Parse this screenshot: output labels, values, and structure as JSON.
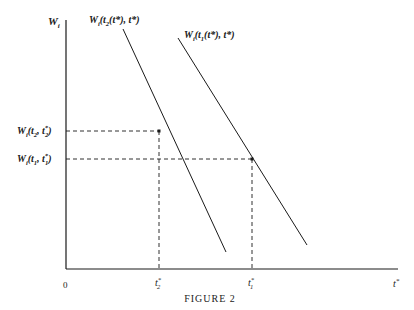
{
  "figure": {
    "caption": "Figure 2",
    "caption_display": "FIGURE 2",
    "y_axis_label": {
      "base": "W",
      "sub": "i"
    },
    "x_axis_label": {
      "base": "t",
      "sup": "*"
    },
    "origin_label": "0",
    "curves": [
      {
        "name": "W_i(t_2(t*), t*)",
        "label_parts": [
          "W",
          "i",
          "(t",
          "2",
          "(t*), t*)"
        ],
        "start": [
          123,
          29
        ],
        "end": [
          226,
          252
        ]
      },
      {
        "name": "W_i(t_1(t*), t*)",
        "label_parts": [
          "W",
          "i",
          "(t",
          "1",
          "(t*), t*)"
        ],
        "start": [
          178,
          38
        ],
        "end": [
          307,
          245
        ]
      }
    ],
    "points": [
      {
        "name": "W_i(t_2, t_2*)",
        "y_label": {
          "base": "W",
          "sub1": "i",
          "mid": "(t",
          "sub2": "2",
          "rest": ", t",
          "sup": "*",
          "sub3": "2",
          "close": ")"
        },
        "x_label": {
          "base": "t",
          "sup": "*",
          "sub": "2"
        },
        "pos": [
          159,
          131
        ]
      },
      {
        "name": "W_i(t_1, t_1*)",
        "y_label": {
          "base": "W",
          "sub1": "i",
          "mid": "(t",
          "sub2": "1",
          "rest": ", t",
          "sup": "*",
          "sub3": "1",
          "close": ")"
        },
        "x_label": {
          "base": "t",
          "sup": "*",
          "sub": "1"
        },
        "pos": [
          252,
          159
        ]
      }
    ],
    "colors": {
      "ink": "#1a1a1a",
      "background": "#ffffff"
    }
  }
}
